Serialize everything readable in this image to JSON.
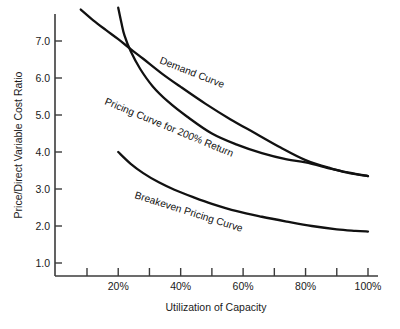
{
  "chart_data": {
    "type": "line",
    "title": "",
    "xlabel": "Utilization of Capacity",
    "ylabel": "Price/Direct Variable Cost Ratio",
    "xlim": [
      0,
      105
    ],
    "ylim": [
      0,
      7.8
    ],
    "grid": false,
    "legend_position": "inline-curve-labels",
    "x_tick_labels": [
      "20%",
      "40%",
      "60%",
      "80%",
      "100%"
    ],
    "x_tick_values": [
      20,
      40,
      60,
      80,
      100
    ],
    "x_minor_tick_values": [
      10,
      30,
      50,
      70,
      90
    ],
    "y_tick_labels": [
      "1.0",
      "2.0",
      "3.0",
      "4.0",
      "5.0",
      "6.0",
      "7.0"
    ],
    "y_tick_values": [
      1.0,
      2.0,
      3.0,
      4.0,
      5.0,
      6.0,
      7.0
    ],
    "series": [
      {
        "name": "Demand Curve",
        "label": "Demand Curve",
        "x": [
          8,
          12,
          16,
          20,
          24,
          28,
          34,
          40,
          48,
          56,
          64,
          72,
          80,
          88,
          94,
          100
        ],
        "values": [
          7.85,
          7.56,
          7.3,
          7.05,
          6.78,
          6.52,
          6.12,
          5.76,
          5.3,
          4.88,
          4.5,
          4.12,
          3.78,
          3.56,
          3.44,
          3.35
        ]
      },
      {
        "name": "Pricing Curve for 200% Return",
        "label": "Pricing Curve for 200% Return",
        "x": [
          20,
          21,
          22,
          24,
          27,
          31,
          36,
          42,
          50,
          58,
          66,
          74,
          80,
          88,
          94,
          100
        ],
        "values": [
          7.9,
          7.5,
          7.15,
          6.72,
          6.25,
          5.78,
          5.36,
          4.96,
          4.5,
          4.2,
          3.97,
          3.8,
          3.72,
          3.55,
          3.43,
          3.35
        ]
      },
      {
        "name": "Breakeven Pricing Curve",
        "label": "Breakeven Pricing Curve",
        "x": [
          20,
          24,
          28,
          33,
          38,
          44,
          50,
          58,
          66,
          74,
          82,
          90,
          96,
          100
        ],
        "values": [
          4.0,
          3.68,
          3.43,
          3.18,
          2.98,
          2.78,
          2.6,
          2.4,
          2.25,
          2.12,
          2.0,
          1.91,
          1.87,
          1.85
        ]
      }
    ]
  }
}
